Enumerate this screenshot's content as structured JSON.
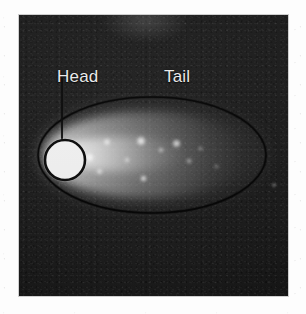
{
  "figure": {
    "kind": "fluorescence-micrograph",
    "panel": {
      "background_color": "#141414",
      "left": 19,
      "top": 15,
      "width": 269,
      "height": 281
    },
    "page_background_color": "#fdfdfd"
  },
  "annotations": {
    "head": {
      "label": "Head",
      "text_color": "#ebebeb",
      "leader_line": {
        "name": "head-leader-line",
        "x1": 62,
        "y1": 78,
        "x2": 62,
        "y2": 140,
        "color": "#0a0a0a"
      },
      "marker_circle": {
        "name": "head-circle-marker",
        "cx": 65,
        "cy": 160,
        "r": 20,
        "fill": "#f2f2f2",
        "stroke": "#0b0b0b",
        "stroke_width": 2.6
      }
    },
    "tail": {
      "label": "Tail",
      "text_color": "#ebebeb"
    },
    "comet_outline": {
      "name": "comet-outline-ellipse",
      "cx": 152,
      "cy": 155,
      "rx": 114,
      "ry": 58,
      "stroke": "#060606",
      "stroke_width": 1.6,
      "fill": "none"
    }
  },
  "comet_signal": {
    "halo": {
      "left": 20,
      "top": 82,
      "width": 232,
      "height": 116
    },
    "tail_smear": {
      "left": 26,
      "top": 97,
      "width": 205,
      "height": 86
    },
    "core_streak": {
      "left": 36,
      "top": 122,
      "width": 130,
      "height": 34
    },
    "puncta": [
      {
        "left": 84,
        "top": 152,
        "size": 11,
        "intensity": 0.95
      },
      {
        "left": 103,
        "top": 138,
        "size": 8,
        "intensity": 0.8
      },
      {
        "left": 96,
        "top": 168,
        "size": 7,
        "intensity": 0.72
      },
      {
        "left": 124,
        "top": 157,
        "size": 6,
        "intensity": 0.65
      },
      {
        "left": 136,
        "top": 136,
        "size": 10,
        "intensity": 0.92
      },
      {
        "left": 140,
        "top": 175,
        "size": 7,
        "intensity": 0.88
      },
      {
        "left": 158,
        "top": 147,
        "size": 6,
        "intensity": 0.6
      },
      {
        "left": 172,
        "top": 139,
        "size": 9,
        "intensity": 0.84
      },
      {
        "left": 186,
        "top": 158,
        "size": 6,
        "intensity": 0.55
      },
      {
        "left": 198,
        "top": 146,
        "size": 5,
        "intensity": 0.48
      },
      {
        "left": 214,
        "top": 164,
        "size": 5,
        "intensity": 0.4
      },
      {
        "left": 272,
        "top": 183,
        "size": 4,
        "intensity": 0.7
      }
    ]
  }
}
